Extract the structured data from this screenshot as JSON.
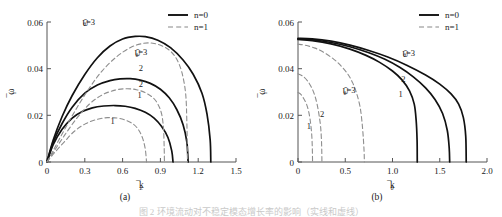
{
  "figure": {
    "caption": "图 2  环境流动对不稳定模态增长率的影响（实线和虚线）",
    "panels": [
      {
        "id": "a",
        "caption_label": "(a)",
        "legend": [
          {
            "label": "n=0",
            "style": "solid"
          },
          {
            "label": "n=1",
            "style": "dashed"
          }
        ],
        "curve_labels": [
          {
            "text": "Ūθ=3",
            "series": "n=0",
            "x": 0.33,
            "y": 0.0585
          },
          {
            "text": "Ūθ=3",
            "series": "n=1",
            "x": 0.745,
            "y": 0.0455
          },
          {
            "text": "2",
            "series": "n=0",
            "x": 0.745,
            "y": 0.0392
          },
          {
            "text": "2",
            "series": "n=1",
            "x": 0.745,
            "y": 0.032
          },
          {
            "text": "1",
            "series": "n=0",
            "x": 0.735,
            "y": 0.0275
          },
          {
            "text": "1",
            "series": "n=1",
            "x": 0.52,
            "y": 0.0165
          }
        ]
      },
      {
        "id": "b",
        "caption_label": "(b)",
        "legend": [
          {
            "label": "n=0",
            "style": "solid"
          },
          {
            "label": "n=1",
            "style": "dashed"
          }
        ],
        "curve_labels": [
          {
            "text": "Ūθ=3",
            "series": "n=0",
            "x": 1.17,
            "y": 0.0452
          },
          {
            "text": "2",
            "series": "n=0",
            "x": 1.115,
            "y": 0.0345
          },
          {
            "text": "1",
            "series": "n=0",
            "x": 1.085,
            "y": 0.0277
          },
          {
            "text": "Ūθ=3",
            "series": "n=1",
            "x": 0.54,
            "y": 0.029
          },
          {
            "text": "2",
            "series": "n=1",
            "x": 0.255,
            "y": 0.0195
          },
          {
            "text": "1",
            "series": "n=1",
            "x": 0.115,
            "y": 0.014
          }
        ]
      }
    ]
  },
  "chart_data": [
    {
      "type": "line",
      "panel": "a",
      "title": "",
      "xlabel": "k̄_z",
      "ylabel": "ω̄_i",
      "xlim": [
        0,
        1.5
      ],
      "ylim": [
        0,
        0.06
      ],
      "xticks": [
        0,
        0.3,
        0.6,
        0.9,
        1.2,
        1.5
      ],
      "xticklabels": [
        "0",
        "0.3",
        "0.6",
        "0.9",
        "1.2",
        "1.5"
      ],
      "yticks": [
        0,
        0.02,
        0.04,
        0.06
      ],
      "yticklabels": [
        "0",
        "0.02",
        "0.04",
        "0.06"
      ],
      "grid": false,
      "legend_position": "top-right",
      "series": [
        {
          "name": "n=0, Ūθ=3",
          "style": "solid",
          "points": [
            [
              0,
              0
            ],
            [
              0.05,
              0.0095
            ],
            [
              0.12,
              0.0195
            ],
            [
              0.2,
              0.0285
            ],
            [
              0.3,
              0.0375
            ],
            [
              0.4,
              0.0447
            ],
            [
              0.5,
              0.0497
            ],
            [
              0.6,
              0.0527
            ],
            [
              0.7,
              0.0538
            ],
            [
              0.78,
              0.0537
            ],
            [
              0.88,
              0.0522
            ],
            [
              0.98,
              0.049
            ],
            [
              1.08,
              0.0437
            ],
            [
              1.16,
              0.0376
            ],
            [
              1.23,
              0.0295
            ],
            [
              1.27,
              0.0205
            ],
            [
              1.295,
              0.0095
            ],
            [
              1.3,
              0
            ]
          ]
        },
        {
          "name": "n=0, Ūθ=2",
          "style": "solid",
          "points": [
            [
              0,
              0
            ],
            [
              0.05,
              0.0085
            ],
            [
              0.12,
              0.0165
            ],
            [
              0.2,
              0.0235
            ],
            [
              0.3,
              0.0295
            ],
            [
              0.4,
              0.033
            ],
            [
              0.5,
              0.0349
            ],
            [
              0.58,
              0.0356
            ],
            [
              0.66,
              0.0357
            ],
            [
              0.74,
              0.0351
            ],
            [
              0.82,
              0.0337
            ],
            [
              0.9,
              0.0312
            ],
            [
              0.97,
              0.0275
            ],
            [
              1.03,
              0.0225
            ],
            [
              1.08,
              0.016
            ],
            [
              1.11,
              0.0085
            ],
            [
              1.12,
              0
            ]
          ]
        },
        {
          "name": "n=0, Ūθ=1",
          "style": "solid",
          "points": [
            [
              0,
              0
            ],
            [
              0.05,
              0.0075
            ],
            [
              0.12,
              0.014
            ],
            [
              0.2,
              0.0188
            ],
            [
              0.28,
              0.0216
            ],
            [
              0.36,
              0.0232
            ],
            [
              0.45,
              0.024
            ],
            [
              0.54,
              0.0242
            ],
            [
              0.62,
              0.0239
            ],
            [
              0.7,
              0.023
            ],
            [
              0.78,
              0.0213
            ],
            [
              0.85,
              0.0188
            ],
            [
              0.91,
              0.0152
            ],
            [
              0.96,
              0.0105
            ],
            [
              0.99,
              0.0048
            ],
            [
              1.0,
              0
            ]
          ]
        },
        {
          "name": "n=1, Ūθ=3",
          "style": "dashed",
          "points": [
            [
              0,
              0
            ],
            [
              0.06,
              0.006
            ],
            [
              0.14,
              0.014
            ],
            [
              0.24,
              0.0235
            ],
            [
              0.34,
              0.032
            ],
            [
              0.44,
              0.0392
            ],
            [
              0.55,
              0.045
            ],
            [
              0.66,
              0.049
            ],
            [
              0.76,
              0.0508
            ],
            [
              0.84,
              0.0509
            ],
            [
              0.92,
              0.0496
            ],
            [
              0.98,
              0.0475
            ],
            [
              1.03,
              0.044
            ],
            [
              1.07,
              0.0385
            ],
            [
              1.1,
              0.0295
            ],
            [
              1.11,
              0.017
            ],
            [
              1.115,
              0
            ]
          ]
        },
        {
          "name": "n=1, Ūθ=2",
          "style": "dashed",
          "points": [
            [
              0,
              0
            ],
            [
              0.06,
              0.005
            ],
            [
              0.14,
              0.0115
            ],
            [
              0.24,
              0.019
            ],
            [
              0.34,
              0.025
            ],
            [
              0.44,
              0.0288
            ],
            [
              0.54,
              0.0308
            ],
            [
              0.63,
              0.0314
            ],
            [
              0.71,
              0.031
            ],
            [
              0.78,
              0.0297
            ],
            [
              0.84,
              0.0276
            ],
            [
              0.88,
              0.0248
            ],
            [
              0.91,
              0.0205
            ],
            [
              0.925,
              0.014
            ],
            [
              0.93,
              0.006
            ],
            [
              0.932,
              0
            ]
          ]
        },
        {
          "name": "n=1, Ūθ=1",
          "style": "dashed",
          "points": [
            [
              0,
              0
            ],
            [
              0.06,
              0.004
            ],
            [
              0.14,
              0.0088
            ],
            [
              0.22,
              0.0133
            ],
            [
              0.31,
              0.0165
            ],
            [
              0.4,
              0.0183
            ],
            [
              0.48,
              0.019
            ],
            [
              0.56,
              0.0188
            ],
            [
              0.63,
              0.0178
            ],
            [
              0.69,
              0.016
            ],
            [
              0.73,
              0.0135
            ],
            [
              0.76,
              0.01
            ],
            [
              0.78,
              0.0055
            ],
            [
              0.79,
              0
            ]
          ]
        }
      ]
    },
    {
      "type": "line",
      "panel": "b",
      "title": "",
      "xlabel": "k̄_θ",
      "ylabel": "ω̄_i",
      "xlim": [
        0,
        2.0
      ],
      "ylim": [
        0,
        0.06
      ],
      "xticks": [
        0,
        0.5,
        1.0,
        1.5,
        2.0
      ],
      "xticklabels": [
        "0",
        "0.5",
        "1.0",
        "1.5",
        "2.0"
      ],
      "yticks": [
        0,
        0.02,
        0.04,
        0.06
      ],
      "yticklabels": [
        "0",
        "0.02",
        "0.04",
        "0.06"
      ],
      "grid": false,
      "legend_position": "top-right",
      "series": [
        {
          "name": "n=0, Ūθ=3",
          "style": "solid",
          "points": [
            [
              0,
              0.053
            ],
            [
              0.15,
              0.0528
            ],
            [
              0.35,
              0.0518
            ],
            [
              0.55,
              0.0501
            ],
            [
              0.75,
              0.0478
            ],
            [
              0.95,
              0.045
            ],
            [
              1.15,
              0.0415
            ],
            [
              1.35,
              0.0373
            ],
            [
              1.5,
              0.0334
            ],
            [
              1.62,
              0.0292
            ],
            [
              1.7,
              0.0248
            ],
            [
              1.75,
              0.019
            ],
            [
              1.775,
              0.011
            ],
            [
              1.78,
              0
            ]
          ]
        },
        {
          "name": "n=0, Ūθ=2",
          "style": "solid",
          "points": [
            [
              0,
              0.0528
            ],
            [
              0.15,
              0.0524
            ],
            [
              0.35,
              0.0512
            ],
            [
              0.55,
              0.0494
            ],
            [
              0.75,
              0.0468
            ],
            [
              0.92,
              0.044
            ],
            [
              1.08,
              0.0405
            ],
            [
              1.22,
              0.0365
            ],
            [
              1.35,
              0.0318
            ],
            [
              1.45,
              0.0268
            ],
            [
              1.53,
              0.0208
            ],
            [
              1.58,
              0.0135
            ],
            [
              1.6,
              0.006
            ],
            [
              1.605,
              0
            ]
          ]
        },
        {
          "name": "n=0, Ūθ=1",
          "style": "solid",
          "points": [
            [
              0,
              0.0525
            ],
            [
              0.15,
              0.052
            ],
            [
              0.35,
              0.0506
            ],
            [
              0.55,
              0.0484
            ],
            [
              0.72,
              0.0457
            ],
            [
              0.86,
              0.0428
            ],
            [
              1.0,
              0.039
            ],
            [
              1.1,
              0.0352
            ],
            [
              1.18,
              0.0305
            ],
            [
              1.23,
              0.0248
            ],
            [
              1.25,
              0.018
            ],
            [
              1.26,
              0.0095
            ],
            [
              1.262,
              0
            ]
          ]
        },
        {
          "name": "n=1, Ūθ=3",
          "style": "dashed",
          "points": [
            [
              0,
              0.0505
            ],
            [
              0.08,
              0.05
            ],
            [
              0.18,
              0.0488
            ],
            [
              0.28,
              0.0468
            ],
            [
              0.38,
              0.044
            ],
            [
              0.46,
              0.041
            ],
            [
              0.53,
              0.0375
            ],
            [
              0.58,
              0.0338
            ],
            [
              0.62,
              0.0295
            ],
            [
              0.655,
              0.024
            ],
            [
              0.675,
              0.018
            ],
            [
              0.69,
              0.011
            ],
            [
              0.7,
              0.004
            ],
            [
              0.702,
              0
            ]
          ]
        },
        {
          "name": "n=1, Ūθ=2",
          "style": "dashed",
          "points": [
            [
              0,
              0.0378
            ],
            [
              0.05,
              0.0368
            ],
            [
              0.1,
              0.0348
            ],
            [
              0.145,
              0.0318
            ],
            [
              0.18,
              0.0282
            ],
            [
              0.205,
              0.0242
            ],
            [
              0.225,
              0.0196
            ],
            [
              0.24,
              0.0148
            ],
            [
              0.248,
              0.0095
            ],
            [
              0.252,
              0.004
            ],
            [
              0.253,
              0
            ]
          ]
        },
        {
          "name": "n=1, Ūθ=1",
          "style": "dashed",
          "points": [
            [
              0,
              0.0298
            ],
            [
              0.03,
              0.029
            ],
            [
              0.06,
              0.0272
            ],
            [
              0.09,
              0.0248
            ],
            [
              0.112,
              0.0218
            ],
            [
              0.128,
              0.0182
            ],
            [
              0.14,
              0.0142
            ],
            [
              0.148,
              0.0098
            ],
            [
              0.152,
              0.005
            ],
            [
              0.154,
              0
            ]
          ]
        }
      ]
    }
  ]
}
